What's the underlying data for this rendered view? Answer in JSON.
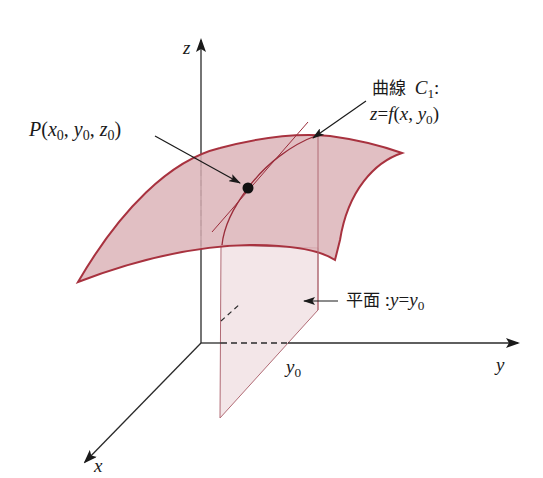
{
  "diagram": {
    "type": "3d-surface-cross-section",
    "colors": {
      "background": "#ffffff",
      "axis": "#2a2a2a",
      "surface_fill": "#dcb4b9",
      "surface_edge": "#a8323f",
      "plane_fill": "#f3e6e8",
      "plane_edge": "#b06a74",
      "curve": "#9a2c3a",
      "point": "#111111"
    },
    "axes": {
      "x": {
        "label": "x"
      },
      "y": {
        "label": "y"
      },
      "z": {
        "label": "z"
      }
    },
    "labels": {
      "point": {
        "name": "P",
        "args": [
          "x",
          "y",
          "z"
        ],
        "sub": "0"
      },
      "curve": {
        "prefix": "曲線",
        "name": "C",
        "sub": "1",
        "suffix": ":"
      },
      "curve_eq": {
        "lhs": "z",
        "eq": "=",
        "func": "f",
        "arg1": "x",
        "arg2": "y",
        "sub": "0"
      },
      "plane": {
        "prefix": "平面",
        "colon": ":",
        "lhs": "y",
        "eq": "=",
        "rhs": "y",
        "sub": "0"
      },
      "y0_tick": {
        "var": "y",
        "sub": "0"
      }
    }
  }
}
